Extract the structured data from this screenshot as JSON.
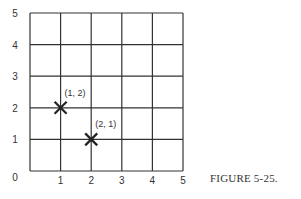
{
  "chart_data": {
    "type": "scatter",
    "title": "",
    "caption": "FIGURE 5-25.",
    "xlabel": "",
    "ylabel": "",
    "xlim": [
      0,
      5
    ],
    "ylim": [
      0,
      5
    ],
    "grid": true,
    "x_ticks": [
      "1",
      "2",
      "3",
      "4",
      "5"
    ],
    "y_ticks": [
      "0",
      "1",
      "2",
      "3",
      "4",
      "5"
    ],
    "points": [
      {
        "x": 1,
        "y": 2,
        "label": "(1, 2)",
        "marker": "x"
      },
      {
        "x": 2,
        "y": 1,
        "label": "(2, 1)",
        "marker": "x"
      }
    ]
  }
}
